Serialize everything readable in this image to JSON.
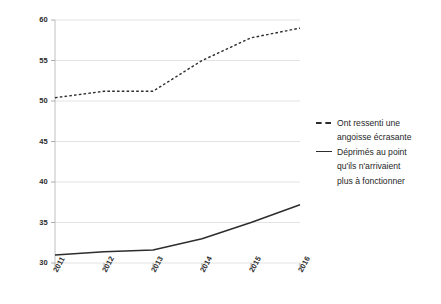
{
  "chart_data": {
    "type": "line",
    "title": "",
    "subtitle": "",
    "xlabel": "",
    "ylabel": "",
    "categories": [
      "2011",
      "2012",
      "2013",
      "2014",
      "2015",
      "2016"
    ],
    "x": [
      2011,
      2012,
      2013,
      2014,
      2015,
      2016
    ],
    "xlim": [
      2011,
      2016
    ],
    "ylim": [
      30,
      60
    ],
    "y_ticks": [
      30,
      35,
      40,
      45,
      50,
      55,
      60
    ],
    "y_tick_labels": [
      "30",
      "35",
      "40",
      "45",
      "50",
      "55",
      "60"
    ],
    "x_tick_labels": [
      "2011",
      "2012",
      "2013",
      "2014",
      "2015",
      "2016"
    ],
    "grid": true,
    "grid_axis": "y",
    "legend_position": "right",
    "series": [
      {
        "name": "Ont ressenti une angoisse écrasante",
        "style": "dashed",
        "color": "#2d2d2d",
        "values": [
          50.4,
          51.2,
          51.2,
          55.0,
          57.8,
          59.0
        ]
      },
      {
        "name": "Déprimés au point qu'ils n'arrivaient plus à fonctionner",
        "style": "solid",
        "color": "#2d2d2d",
        "values": [
          31.0,
          31.4,
          31.6,
          33.0,
          35.0,
          37.2
        ]
      }
    ]
  },
  "legend": {
    "entries": [
      {
        "marker": "dashed-line-icon",
        "lines": [
          "Ont ressenti une",
          "angoisse écrasante"
        ]
      },
      {
        "marker": "solid-line-icon",
        "lines": [
          "Déprimés au point",
          "qu'ils n'arrivaient",
          "plus à fonctionner"
        ]
      }
    ]
  },
  "axes": {
    "y_labels": [
      "60",
      "55",
      "50",
      "45",
      "40",
      "35",
      "30"
    ],
    "x_labels": [
      "2011",
      "2012",
      "2013",
      "2014",
      "2015",
      "2016"
    ]
  }
}
